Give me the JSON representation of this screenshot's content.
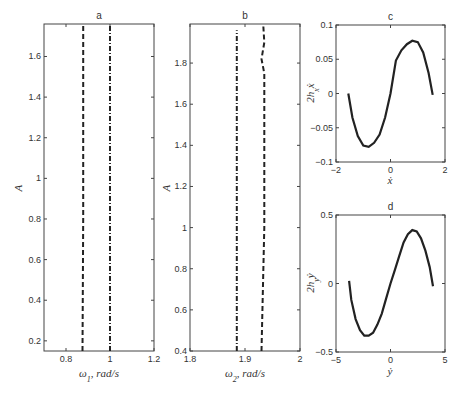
{
  "chart_data": [
    {
      "id": "a",
      "type": "line",
      "title": "a",
      "xlabel": "ω1, rad/s",
      "ylabel": "A",
      "xlim": [
        0.7,
        1.2
      ],
      "ylim": [
        0.15,
        1.76
      ],
      "xticks": [
        "0.8",
        "1",
        "1.2"
      ],
      "yticks": [
        "0.2",
        "0.4",
        "0.6",
        "0.8",
        "1",
        "1.2",
        "1.4",
        "1.6"
      ],
      "grid": false,
      "series": [
        {
          "name": "dashed",
          "style": "dashed",
          "x": [
            0.875,
            0.878,
            0.878
          ],
          "y": [
            0.15,
            0.8,
            1.76
          ]
        },
        {
          "name": "dash-dot",
          "style": "dashdot",
          "x": [
            1.0,
            1.0
          ],
          "y": [
            0.15,
            1.76
          ]
        }
      ]
    },
    {
      "id": "b",
      "type": "line",
      "title": "b",
      "xlabel": "ω2, rad/s",
      "ylabel": "A",
      "xlim": [
        1.8,
        2.0
      ],
      "ylim": [
        0.4,
        1.99
      ],
      "xticks": [
        "1.8",
        "1.9",
        "2"
      ],
      "yticks": [
        "0.4",
        "0.6",
        "0.8",
        "1",
        "1.2",
        "1.4",
        "1.6",
        "1.8"
      ],
      "grid": false,
      "series": [
        {
          "name": "dash-dot",
          "style": "dashdot",
          "x": [
            1.885,
            1.885
          ],
          "y": [
            0.4,
            1.96
          ]
        },
        {
          "name": "dashed",
          "style": "dashed",
          "x": [
            1.93,
            1.935,
            1.935,
            1.93,
            1.935,
            1.933
          ],
          "y": [
            0.4,
            1.0,
            1.75,
            1.82,
            1.9,
            1.99
          ]
        }
      ]
    },
    {
      "id": "c",
      "type": "line",
      "title": "c",
      "xlabel": "ẋ",
      "ylabel": "2hₓẋ",
      "xlim": [
        -2,
        2
      ],
      "ylim": [
        -0.1,
        0.1
      ],
      "xticks": [
        "-2",
        "0",
        "2"
      ],
      "yticks": [
        "-0.1",
        "-0.05",
        "0",
        "0.05",
        "0.1"
      ],
      "grid": false,
      "series": [
        {
          "name": "curve",
          "style": "solid",
          "x": [
            -1.55,
            -1.4,
            -1.2,
            -1.0,
            -0.8,
            -0.6,
            -0.4,
            -0.2,
            0.0,
            0.2,
            0.4,
            0.6,
            0.8,
            1.0,
            1.2,
            1.4,
            1.55
          ],
          "y": [
            0.0,
            -0.035,
            -0.062,
            -0.076,
            -0.078,
            -0.072,
            -0.06,
            -0.035,
            0.0,
            0.048,
            0.063,
            0.072,
            0.077,
            0.075,
            0.06,
            0.03,
            -0.002
          ]
        }
      ]
    },
    {
      "id": "d",
      "type": "line",
      "title": "d",
      "xlabel": "ẏ",
      "ylabel": "2h_yẏ",
      "xlim": [
        -5,
        5
      ],
      "ylim": [
        -0.5,
        0.5
      ],
      "xticks": [
        "-5",
        "0",
        "5"
      ],
      "yticks": [
        "-0.5",
        "0",
        "0.5"
      ],
      "grid": false,
      "series": [
        {
          "name": "curve",
          "style": "solid",
          "x": [
            -3.8,
            -3.6,
            -3.2,
            -2.8,
            -2.4,
            -2.0,
            -1.6,
            -1.2,
            -0.8,
            -0.4,
            0.0,
            0.4,
            0.8,
            1.2,
            1.6,
            2.0,
            2.4,
            2.8,
            3.2,
            3.6,
            3.9
          ],
          "y": [
            0.02,
            -0.12,
            -0.26,
            -0.34,
            -0.38,
            -0.38,
            -0.36,
            -0.3,
            -0.22,
            -0.11,
            0.0,
            0.1,
            0.2,
            0.3,
            0.36,
            0.39,
            0.38,
            0.33,
            0.24,
            0.12,
            -0.02
          ]
        }
      ]
    }
  ],
  "panels": {
    "a": {
      "title": "a",
      "xlabel_main": "ω",
      "xlabel_sub": "1",
      "xlabel_rest": ", rad/s",
      "ylabel": "A"
    },
    "b": {
      "title": "b",
      "xlabel_main": "ω",
      "xlabel_sub": "2",
      "xlabel_rest": ", rad/s",
      "ylabel": "A"
    },
    "c": {
      "title": "c",
      "xlabel": "ẋ",
      "ylabel_main": "2h",
      "ylabel_sub": "x",
      "ylabel_rest": "ẋ"
    },
    "d": {
      "title": "d",
      "xlabel": "ẏ",
      "ylabel_main": "2h",
      "ylabel_sub": "y",
      "ylabel_rest": "ẏ"
    }
  }
}
